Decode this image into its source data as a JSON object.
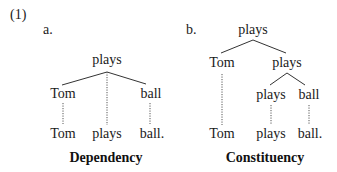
{
  "example_number": "(1)",
  "panel_a": {
    "label": "a.",
    "root": "plays",
    "children": [
      "Tom",
      "ball"
    ],
    "leaves": [
      "Tom",
      "plays",
      "ball."
    ],
    "caption": "Dependency"
  },
  "panel_b": {
    "label": "b.",
    "root": "plays",
    "level1": [
      "Tom",
      "plays"
    ],
    "level2": [
      "plays",
      "ball"
    ],
    "leaves": [
      "Tom",
      "plays",
      "ball."
    ],
    "caption": "Constituency"
  }
}
